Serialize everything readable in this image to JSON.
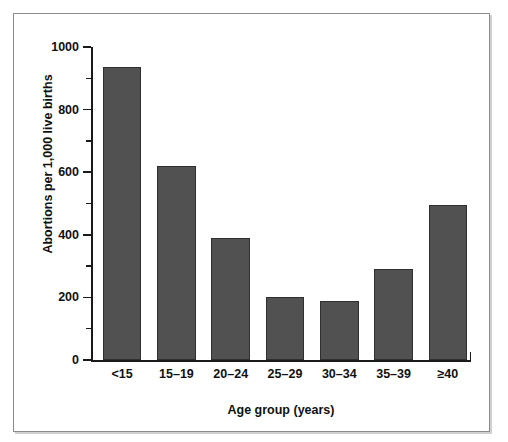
{
  "figure": {
    "caption_remnant": "",
    "frame_border_color": "#8b8b8b",
    "background_color": "#ffffff"
  },
  "chart_data": {
    "type": "bar",
    "title": "",
    "subtitle": "",
    "xlabel": "Age group (years)",
    "ylabel": "Abortions per 1,000 live births",
    "categories": [
      "<15",
      "15–19",
      "20–24",
      "25–29",
      "30–34",
      "35–39",
      "≥40"
    ],
    "values": [
      935,
      620,
      390,
      200,
      190,
      290,
      495
    ],
    "ylim": [
      0,
      1000
    ],
    "y_major_ticks": [
      0,
      200,
      400,
      600,
      800,
      1000
    ],
    "y_major_tick_labels": [
      "0",
      "200",
      "400",
      "600",
      "800",
      "1000"
    ],
    "y_minor_ticks": [
      100,
      300,
      500,
      700,
      900
    ],
    "grid": false,
    "legend": false,
    "legend_position": "none",
    "bar_fill_color": "#515151",
    "bar_edge_color": "#2f2f2f",
    "axis_color": "#1a1a1a",
    "series": [
      {
        "name": "Abortions per 1,000 live births",
        "values": [
          935,
          620,
          390,
          200,
          190,
          290,
          495
        ]
      }
    ]
  }
}
